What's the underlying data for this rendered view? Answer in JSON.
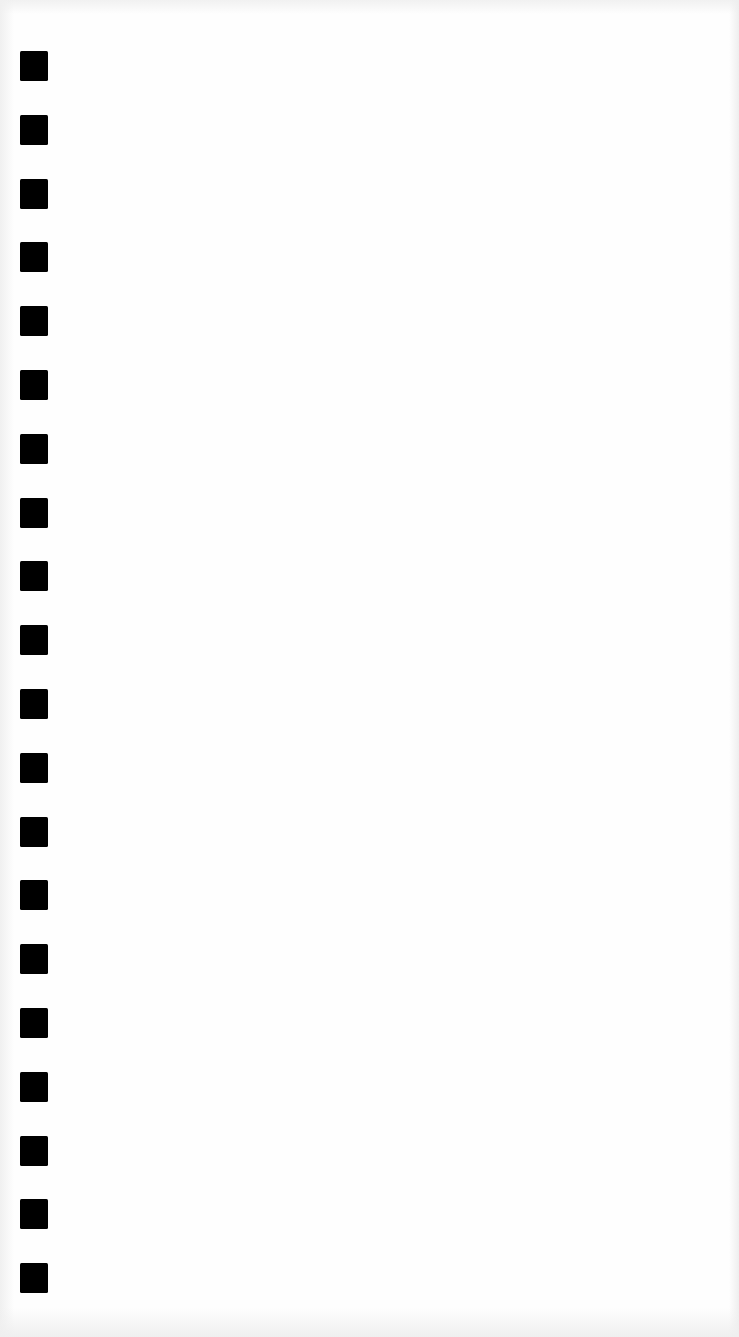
{
  "page": {
    "background_color": "#fefefe",
    "mark_color": "#000000"
  },
  "marks": {
    "count": 20,
    "left_px": 20,
    "first_top_px": 51,
    "pitch_px": 63.8,
    "width_px": 28,
    "height_px": 30
  }
}
